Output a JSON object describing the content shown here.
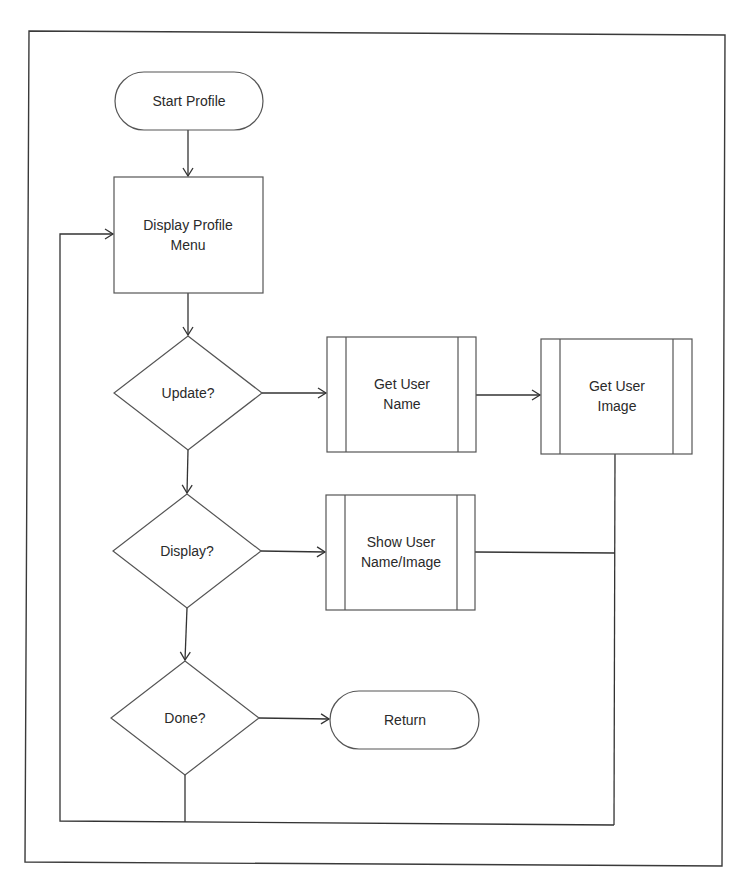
{
  "diagram": {
    "type": "flowchart",
    "nodes": {
      "start": {
        "shape": "terminator",
        "lines": [
          "Start Profile"
        ]
      },
      "menu": {
        "shape": "process",
        "lines": [
          "Display Profile",
          "Menu"
        ]
      },
      "update": {
        "shape": "decision",
        "lines": [
          "Update?"
        ]
      },
      "get_name": {
        "shape": "predefined-process",
        "lines": [
          "Get User",
          "Name"
        ]
      },
      "get_image": {
        "shape": "predefined-process",
        "lines": [
          "Get User",
          "Image"
        ]
      },
      "display": {
        "shape": "decision",
        "lines": [
          "Display?"
        ]
      },
      "show": {
        "shape": "predefined-process",
        "lines": [
          "Show User",
          "Name/Image"
        ]
      },
      "done": {
        "shape": "decision",
        "lines": [
          "Done?"
        ]
      },
      "return": {
        "shape": "terminator",
        "lines": [
          "Return"
        ]
      }
    },
    "edges": [
      {
        "from": "start",
        "to": "menu"
      },
      {
        "from": "menu",
        "to": "update"
      },
      {
        "from": "update",
        "to": "get_name"
      },
      {
        "from": "get_name",
        "to": "get_image"
      },
      {
        "from": "update",
        "to": "display"
      },
      {
        "from": "display",
        "to": "show"
      },
      {
        "from": "display",
        "to": "done"
      },
      {
        "from": "done",
        "to": "return"
      },
      {
        "from": "get_image",
        "to": "menu",
        "route": "loop-back"
      },
      {
        "from": "show",
        "to": "menu",
        "route": "loop-back"
      },
      {
        "from": "done",
        "to": "menu",
        "route": "loop-back"
      }
    ],
    "colors": {
      "background": "#ffffff",
      "stroke": "#555555",
      "text": "#2a2a2a"
    }
  }
}
